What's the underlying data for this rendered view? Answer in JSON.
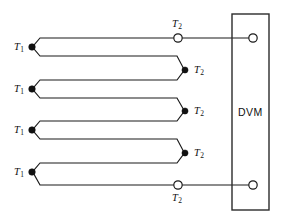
{
  "diagram": {
    "type": "schematic",
    "canvas": {
      "width": 288,
      "height": 222
    },
    "colors": {
      "wire": "#1a1a1a",
      "box": "#2b2b2b",
      "junction_fill": "#111111",
      "terminal_fill": "#ffffff",
      "background": "#ffffff"
    },
    "meter": {
      "label": "DVM",
      "box": {
        "x": 232,
        "y": 14,
        "width": 37,
        "height": 196
      },
      "label_pos": {
        "x": 250,
        "y": 112
      },
      "terminals": [
        {
          "name": "dvm-terminal-top",
          "cx": 253,
          "cy": 38,
          "r": 4.2,
          "style": "open"
        },
        {
          "name": "dvm-terminal-bottom",
          "cx": 253,
          "cy": 185,
          "r": 4.2,
          "style": "open"
        }
      ]
    },
    "measuring_junctions": [
      {
        "id": "t1-1",
        "label": "T",
        "sub": "1",
        "x": 32,
        "y": 47,
        "label_x": 14,
        "label_y": 42
      },
      {
        "id": "t1-2",
        "label": "T",
        "sub": "1",
        "x": 32,
        "y": 89,
        "label_x": 14,
        "label_y": 84
      },
      {
        "id": "t1-3",
        "label": "T",
        "sub": "1",
        "x": 32,
        "y": 130,
        "label_x": 14,
        "label_y": 125
      },
      {
        "id": "t1-4",
        "label": "T",
        "sub": "1",
        "x": 32,
        "y": 172,
        "label_x": 14,
        "label_y": 167
      }
    ],
    "reference_junctions": [
      {
        "id": "t2-top",
        "label": "T",
        "sub": "2",
        "x": 178,
        "y": 38,
        "style": "open",
        "label_x": 172,
        "label_y": 19
      },
      {
        "id": "t2-2",
        "label": "T",
        "sub": "2",
        "x": 185,
        "y": 70,
        "style": "filled",
        "label_x": 194,
        "label_y": 65
      },
      {
        "id": "t2-3",
        "label": "T",
        "sub": "2",
        "x": 185,
        "y": 111,
        "style": "filled",
        "label_x": 194,
        "label_y": 106
      },
      {
        "id": "t2-4",
        "label": "T",
        "sub": "2",
        "x": 185,
        "y": 153,
        "style": "filled",
        "label_x": 194,
        "label_y": 148
      },
      {
        "id": "t2-bottom",
        "label": "T",
        "sub": "2",
        "x": 178,
        "y": 185,
        "style": "open",
        "label_x": 172,
        "label_y": 193
      }
    ]
  }
}
